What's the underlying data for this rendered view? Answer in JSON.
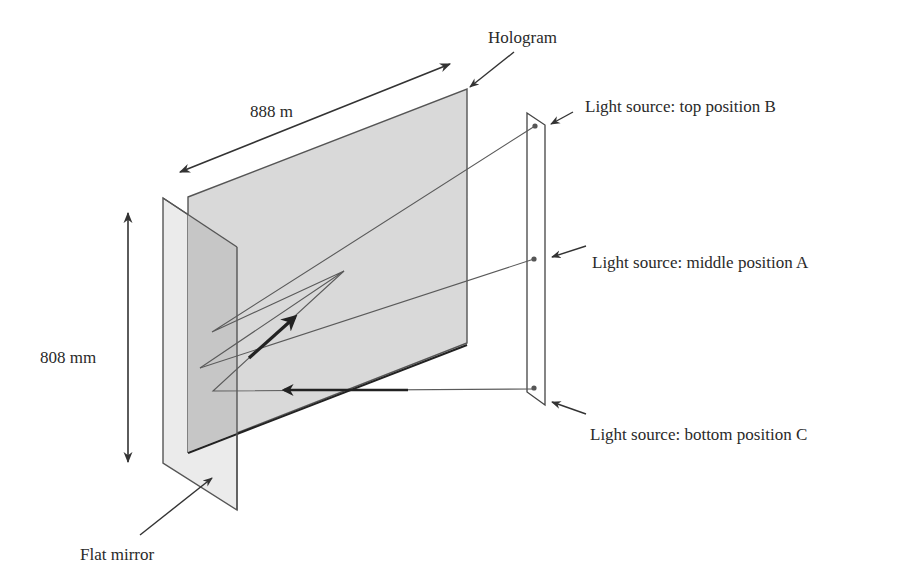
{
  "figure": {
    "labels": {
      "hologram": "Hologram",
      "width_dimension": "888 m",
      "height_dimension": "808 mm",
      "flat_mirror": "Flat mirror",
      "source_top": "Light source: top position B",
      "source_middle": "Light source: middle position A",
      "source_bottom": "Light source: bottom position C"
    },
    "colors": {
      "hologram_fill": "#d9d9d9",
      "mirror_fill": "#ebebeb",
      "mirror_overlap_fill": "#c9c9c9",
      "outline": "#555555",
      "text": "#2a2a2a"
    },
    "elements": [
      {
        "name": "hologram",
        "shape": "parallelogram"
      },
      {
        "name": "flat-mirror",
        "shape": "parallelogram"
      },
      {
        "name": "light-source-bar",
        "shape": "thin parallelogram with 3 source dots"
      },
      {
        "name": "rays",
        "description": "rays from sources B, A, C reflecting between hologram and mirror"
      }
    ]
  }
}
